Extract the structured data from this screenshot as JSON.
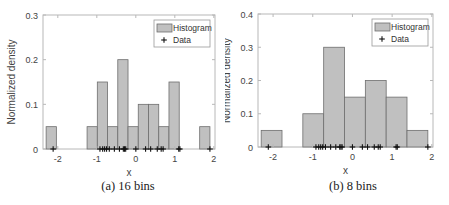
{
  "chart_data": [
    {
      "type": "bar",
      "subtype": "histogram",
      "caption": "(a) 16 bins",
      "title": "",
      "xlabel": "x",
      "ylabel": "Normalized density",
      "xlim": [
        -2.38,
        2.03
      ],
      "ylim": [
        0,
        0.3
      ],
      "xticks": [
        -2,
        -1,
        0,
        1,
        2
      ],
      "yticks": [
        0,
        0.1,
        0.2,
        0.3
      ],
      "ytick_labels": [
        "0",
        "0.1",
        "0.2",
        "0.3"
      ],
      "grid": false,
      "legend": {
        "position": "upper right",
        "entries": [
          "Histogram",
          "Data"
        ]
      },
      "bin_edges": [
        -2.3,
        -2.0375,
        -1.775,
        -1.5125,
        -1.25,
        -0.9875,
        -0.725,
        -0.4625,
        -0.2,
        0.0625,
        0.325,
        0.5875,
        0.85,
        1.1125,
        1.375,
        1.6375,
        1.9
      ],
      "values": [
        0.05,
        0,
        0,
        0,
        0.05,
        0.15,
        0.05,
        0.2,
        0.05,
        0.1,
        0.1,
        0.05,
        0.15,
        0,
        0,
        0.05
      ],
      "series": [
        {
          "name": "Histogram",
          "values": [
            0.05,
            0,
            0,
            0,
            0.05,
            0.15,
            0.05,
            0.2,
            0.05,
            0.1,
            0.1,
            0.05,
            0.15,
            0,
            0,
            0.05
          ]
        },
        {
          "name": "Data",
          "x": [
            -2.12,
            -0.92,
            -0.85,
            -0.8,
            -0.75,
            -0.68,
            -0.55,
            -0.42,
            -0.32,
            -0.29,
            -0.26,
            0.0,
            0.25,
            0.38,
            0.55,
            0.65,
            0.7,
            1.1,
            1.13,
            1.9
          ],
          "y": 0
        }
      ]
    },
    {
      "type": "bar",
      "subtype": "histogram",
      "caption": "(b) 8 bins",
      "title": "",
      "xlabel": "x",
      "ylabel": "Normalized density",
      "xlim": [
        -2.38,
        2.03
      ],
      "ylim": [
        0,
        0.4
      ],
      "xticks": [
        -2,
        -1,
        0,
        1,
        2
      ],
      "yticks": [
        0,
        0.1,
        0.2,
        0.3,
        0.4
      ],
      "ytick_labels": [
        "0",
        "0.1",
        "0.2",
        "0.3",
        "0.4"
      ],
      "grid": false,
      "legend": {
        "position": "upper right",
        "entries": [
          "Histogram",
          "Data"
        ]
      },
      "bin_edges": [
        -2.3,
        -1.775,
        -1.25,
        -0.725,
        -0.2,
        0.325,
        0.85,
        1.375,
        1.9
      ],
      "values": [
        0.05,
        0,
        0.1,
        0.3,
        0.15,
        0.2,
        0.15,
        0.05
      ],
      "series": [
        {
          "name": "Histogram",
          "values": [
            0.05,
            0,
            0.1,
            0.3,
            0.15,
            0.2,
            0.15,
            0.05
          ]
        },
        {
          "name": "Data",
          "x": [
            -2.12,
            -0.92,
            -0.85,
            -0.8,
            -0.75,
            -0.68,
            -0.55,
            -0.42,
            -0.32,
            -0.29,
            -0.26,
            0.0,
            0.25,
            0.38,
            0.55,
            0.65,
            0.7,
            1.1,
            1.13,
            1.9
          ],
          "y": 0
        }
      ]
    }
  ],
  "style": {
    "bar_fill": "#c0c0c0",
    "bar_edge": "#6e6e6e",
    "axis_color": "#b8b8b8",
    "tick_text": "#444444",
    "marker_color": "#111111"
  },
  "panels": [
    {
      "caption": "(a) 16 bins",
      "xlabel": "x",
      "ylabel": "Normalized density",
      "legend_hist": "Histogram",
      "legend_data": "Data"
    },
    {
      "caption": "(b) 8 bins",
      "xlabel": "x",
      "ylabel": "Normalized density",
      "legend_hist": "Histogram",
      "legend_data": "Data"
    }
  ]
}
